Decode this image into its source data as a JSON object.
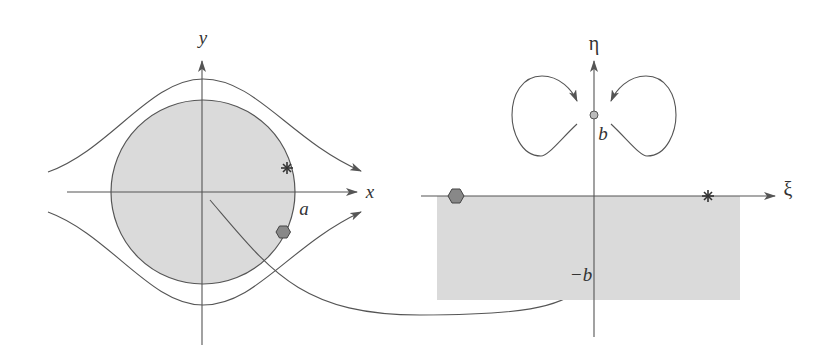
{
  "left_panel": {
    "title": "z-plane (flow past circular cylinder)",
    "axis_x_label": "x",
    "axis_y_label": "y",
    "radius_label": "a",
    "markers": [
      {
        "shape": "asterisk",
        "position": "on circle, upper right"
      },
      {
        "shape": "hexagon",
        "position": "on circle, lower right"
      }
    ],
    "fill_color": "#d9d9d9",
    "stroke_color": "#555555"
  },
  "right_panel": {
    "title": "ζ-plane (mapped domain)",
    "axis_xi_label": "ξ",
    "axis_eta_label": "η",
    "point_b_label": "b",
    "point_neg_b_label": "−b",
    "markers": [
      {
        "shape": "hexagon",
        "position": "left end of ξ axis"
      },
      {
        "shape": "asterisk",
        "position": "right on ξ axis"
      },
      {
        "shape": "small-circle",
        "position": "η = b"
      }
    ],
    "fill_color": "#d9d9d9"
  },
  "mapping_arrow": {
    "description": "curved arrow from cylinder center to point −b"
  }
}
